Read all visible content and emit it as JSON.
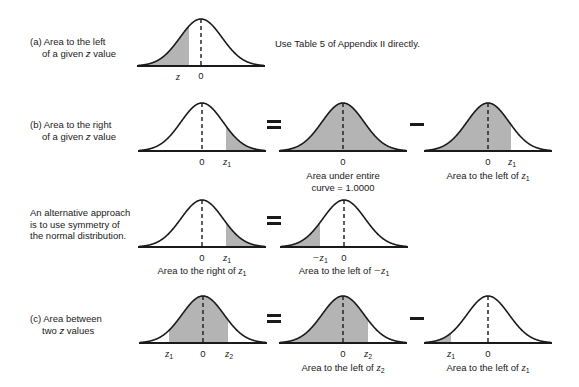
{
  "sections": {
    "a": {
      "label_line1": "(a) Area to the left",
      "label_line2_pre": "of a given ",
      "label_line2_var": "z",
      "label_line2_post": " value",
      "note": "Use Table 5 of Appendix II directly.",
      "ticks": {
        "z": "z",
        "zero": "0"
      }
    },
    "b": {
      "label_line1": "(b) Area to the right",
      "label_line2_pre": "of a given ",
      "label_line2_var": "z",
      "label_line2_post": " value",
      "operator1": "=",
      "operator2": "−",
      "panel1": {
        "tick_zero": "0",
        "tick_z": "z",
        "tick_sub": "1"
      },
      "panel2": {
        "tick_zero": "0",
        "caption_line1": "Area under entire",
        "caption_line2": "curve = 1.0000"
      },
      "panel3": {
        "tick_zero": "0",
        "tick_z": "z",
        "tick_sub": "1",
        "caption_pre": "Area to the left of ",
        "caption_var": "z",
        "caption_sub": "1"
      }
    },
    "alt": {
      "label_line1": "An alternative approach",
      "label_line2": "is to use symmetry of",
      "label_line3": "the normal distribution.",
      "operator": "=",
      "panel1": {
        "tick_zero": "0",
        "tick_z": "z",
        "tick_sub": "1",
        "caption_pre": "Area to the right of ",
        "caption_var": "z",
        "caption_sub": "1"
      },
      "panel2": {
        "tick_zero": "0",
        "tick_z": "−z",
        "tick_sub": "1",
        "caption_pre": "Area to the left of ",
        "caption_var": "−z",
        "caption_sub": "1"
      }
    },
    "c": {
      "label_line1": "(c) Area between",
      "label_line2_pre": "two ",
      "label_line2_var": "z",
      "label_line2_post": " values",
      "operator1": "=",
      "operator2": "−",
      "panel1": {
        "tick_z1": "z",
        "tick_z1_sub": "1",
        "tick_zero": "0",
        "tick_z2": "z",
        "tick_z2_sub": "2"
      },
      "panel2": {
        "tick_zero": "0",
        "tick_z": "z",
        "tick_sub": "2",
        "caption_pre": "Area to the left of ",
        "caption_var": "z",
        "caption_sub": "2"
      },
      "panel3": {
        "tick_z": "z",
        "tick_sub": "1",
        "tick_zero": "0",
        "caption_pre": "Area to the left of ",
        "caption_var": "z",
        "caption_sub": "1"
      }
    }
  },
  "colors": {
    "curve": "#1a1a1a",
    "shade": "#b4b4b4",
    "background": "#ffffff"
  },
  "curves": [
    {
      "id": "a",
      "cx": 201,
      "peak": 19,
      "base": 66,
      "shade": [
        140,
        189
      ]
    },
    {
      "id": "b1",
      "cx": 202,
      "peak": 103,
      "base": 151,
      "shade": [
        226,
        265
      ]
    },
    {
      "id": "b2",
      "cx": 343,
      "peak": 103,
      "base": 151,
      "shade": [
        280,
        407
      ]
    },
    {
      "id": "b3",
      "cx": 488,
      "peak": 103,
      "base": 151,
      "shade": [
        424,
        511
      ]
    },
    {
      "id": "alt1",
      "cx": 202,
      "peak": 200,
      "base": 247,
      "shade": [
        226,
        265
      ]
    },
    {
      "id": "alt2",
      "cx": 344,
      "peak": 200,
      "base": 247,
      "shade": [
        281,
        320
      ]
    },
    {
      "id": "c1",
      "cx": 203,
      "peak": 296,
      "base": 343,
      "shade": [
        169,
        228
      ]
    },
    {
      "id": "c2",
      "cx": 343,
      "peak": 296,
      "base": 343,
      "shade": [
        280,
        368
      ]
    },
    {
      "id": "c3",
      "cx": 488,
      "peak": 296,
      "base": 343,
      "shade": [
        425,
        451
      ]
    }
  ]
}
